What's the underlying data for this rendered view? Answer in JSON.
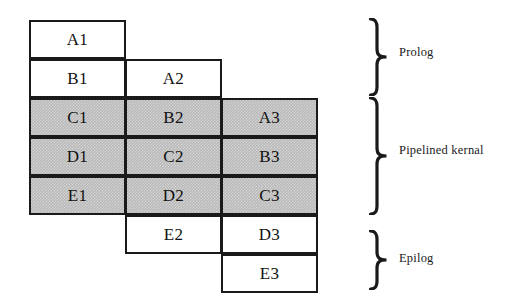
{
  "figure": {
    "type": "software-pipelining-schedule",
    "grid": {
      "columns": 3,
      "rows": 7,
      "cell_width": 97,
      "cell_height": 39,
      "origin_x": 29,
      "origin_y": 20,
      "column_row_offset": 1
    },
    "colors": {
      "shaded_fill": "#b9b9b9",
      "white_fill": "#ffffff",
      "border": "#1a1a1a",
      "text": "#111111"
    },
    "iterations": [
      {
        "name": "iteration-1",
        "column": 0,
        "start_row": 0,
        "cells": [
          {
            "label": "A1",
            "shaded": false
          },
          {
            "label": "B1",
            "shaded": false
          },
          {
            "label": "C1",
            "shaded": true
          },
          {
            "label": "D1",
            "shaded": true
          },
          {
            "label": "E1",
            "shaded": true
          }
        ]
      },
      {
        "name": "iteration-2",
        "column": 1,
        "start_row": 1,
        "cells": [
          {
            "label": "A2",
            "shaded": false
          },
          {
            "label": "B2",
            "shaded": true
          },
          {
            "label": "C2",
            "shaded": true
          },
          {
            "label": "D2",
            "shaded": true
          },
          {
            "label": "E2",
            "shaded": false
          }
        ]
      },
      {
        "name": "iteration-3",
        "column": 2,
        "start_row": 2,
        "cells": [
          {
            "label": "A3",
            "shaded": true
          },
          {
            "label": "B3",
            "shaded": true
          },
          {
            "label": "C3",
            "shaded": true
          },
          {
            "label": "D3",
            "shaded": false
          },
          {
            "label": "E3",
            "shaded": false
          }
        ]
      }
    ],
    "stages": [
      {
        "name": "prolog",
        "label": "Prolog",
        "brace": {
          "x": 368,
          "y": 18,
          "width": 22,
          "height": 78
        },
        "text": {
          "x": 399,
          "y": 45
        }
      },
      {
        "name": "pipelined-kernal",
        "label": "Pipelined kernal",
        "brace": {
          "x": 368,
          "y": 97,
          "width": 22,
          "height": 118
        },
        "text": {
          "x": 399,
          "y": 143
        }
      },
      {
        "name": "epilog",
        "label": "Epilog",
        "brace": {
          "x": 368,
          "y": 230,
          "width": 22,
          "height": 60
        },
        "text": {
          "x": 399,
          "y": 251
        }
      }
    ]
  }
}
